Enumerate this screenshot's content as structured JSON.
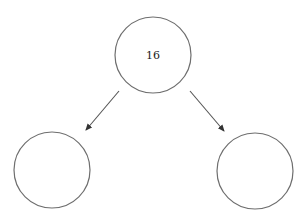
{
  "diagram": {
    "type": "binary-tree",
    "nodes": [
      {
        "id": "root",
        "label": "16",
        "cx": 153,
        "cy": 55,
        "r": 38
      },
      {
        "id": "left-child",
        "label": "",
        "cx": 52,
        "cy": 170,
        "r": 38
      },
      {
        "id": "right-child",
        "label": "",
        "cx": 255,
        "cy": 171,
        "r": 38
      }
    ],
    "edges": [
      {
        "from": "root",
        "to": "left-child"
      },
      {
        "from": "root",
        "to": "right-child"
      }
    ],
    "colors": {
      "stroke": "#6e6e6e",
      "arrow": "#555555",
      "text": "#222222"
    }
  }
}
